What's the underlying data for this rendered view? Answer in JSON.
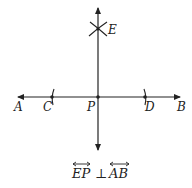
{
  "diagram": {
    "type": "geometric-construction",
    "colors": {
      "stroke": "#222222",
      "background": "#ffffff"
    },
    "points": {
      "A": {
        "label": "A",
        "role": "arrow end of horizontal line (left)"
      },
      "B": {
        "label": "B",
        "role": "arrow end of horizontal line (right)"
      },
      "C": {
        "label": "C",
        "role": "arc intersection on AB left of P"
      },
      "D": {
        "label": "D",
        "role": "arc intersection on AB right of P"
      },
      "P": {
        "label": "P",
        "role": "intersection of EP and AB"
      },
      "E": {
        "label": "E",
        "role": "intersection of arcs above P"
      }
    },
    "lines": [
      {
        "name": "AB",
        "orientation": "horizontal",
        "arrows": "both"
      },
      {
        "name": "EP",
        "orientation": "vertical",
        "arrows": "both"
      }
    ],
    "arcs": [
      "arc through C",
      "arc through D",
      "crossing arcs at E"
    ],
    "caption": {
      "left": "EP",
      "relation": "⊥",
      "right": "AB"
    }
  }
}
